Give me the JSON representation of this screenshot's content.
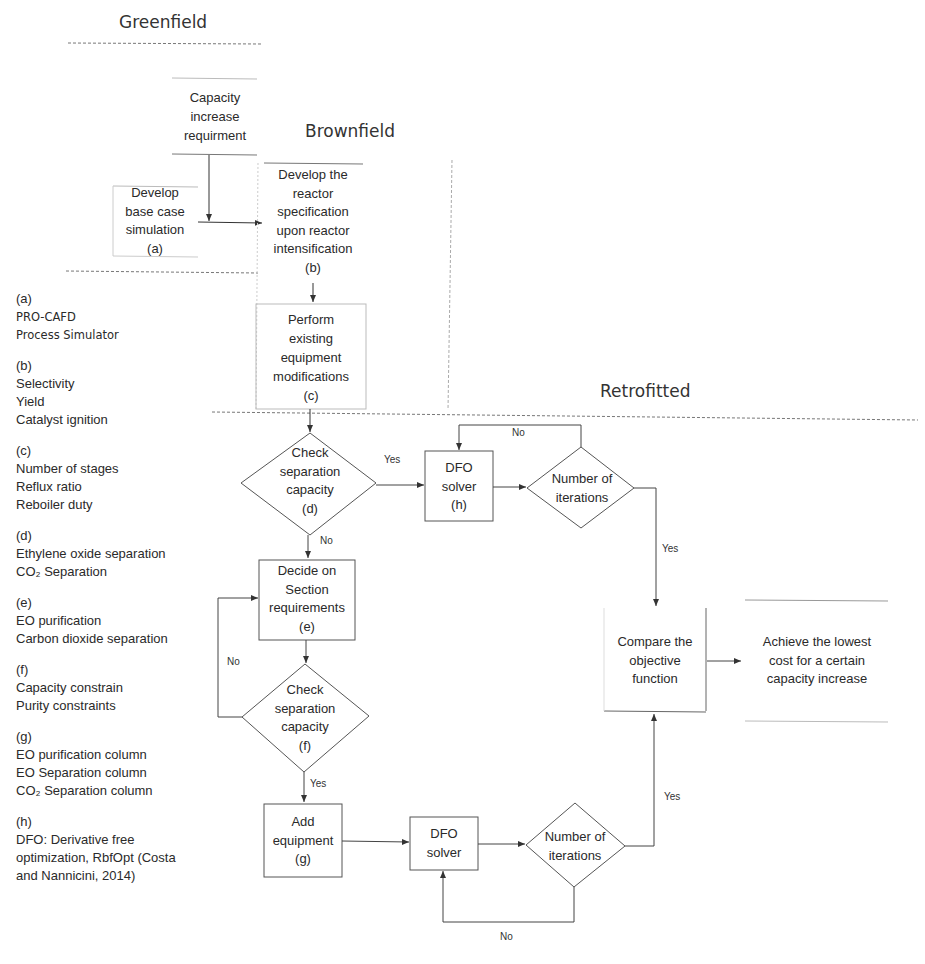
{
  "sections": {
    "greenfield": "Greenfield",
    "brownfield": "Brownfield",
    "retrofitted": "Retrofitted"
  },
  "nodes": {
    "capacity_req": [
      "Capacity",
      "increase",
      "requirment"
    ],
    "base_case": [
      "Develop",
      "base case",
      "simulation",
      "(a)"
    ],
    "reactor_spec": [
      "Develop the",
      "reactor",
      "specification",
      "upon reactor",
      "intensification",
      "(b)"
    ],
    "equip_mod": [
      "Perform",
      "existing",
      "equipment",
      "modifications",
      "(c)"
    ],
    "check_sep_d": [
      "Check",
      "separation",
      "capacity",
      "(d)"
    ],
    "dfo_h": [
      "DFO",
      "solver",
      "(h)"
    ],
    "num_iter_top": [
      "Number of",
      "iterations"
    ],
    "decide_section": [
      "Decide on",
      "Section",
      "requirements",
      "(e)"
    ],
    "check_sep_f": [
      "Check",
      "separation",
      "capacity",
      "(f)"
    ],
    "add_equip": [
      "Add",
      "equipment",
      "(g)"
    ],
    "dfo_bottom": [
      "DFO",
      "solver"
    ],
    "num_iter_bottom": [
      "Number of",
      "iterations"
    ],
    "compare_obj": [
      "Compare the",
      "objective",
      "function"
    ],
    "achieve": [
      "Achieve the lowest",
      "cost for a certain",
      "capacity increase"
    ]
  },
  "edge_labels": {
    "d_yes": "Yes",
    "d_no": "No",
    "top_iter_no": "No",
    "top_iter_yes": "Yes",
    "f_no": "No",
    "f_yes": "Yes",
    "bottom_iter_yes": "Yes",
    "bottom_iter_no": "No"
  },
  "legend": [
    {
      "key": "(a)",
      "items": [
        "PRO-CAFD",
        "Process Simulator"
      ]
    },
    {
      "key": "(b)",
      "items": [
        "Selectivity",
        "Yield",
        "Catalyst ignition"
      ]
    },
    {
      "key": "(c)",
      "items": [
        "Number of stages",
        "Reflux ratio",
        "Reboiler duty"
      ]
    },
    {
      "key": "(d)",
      "items": [
        "Ethylene oxide separation",
        "CO₂ Separation"
      ]
    },
    {
      "key": "(e)",
      "items": [
        "EO purification",
        "Carbon dioxide separation"
      ]
    },
    {
      "key": "(f)",
      "items": [
        "Capacity constrain",
        "Purity constraints"
      ]
    },
    {
      "key": "(g)",
      "items": [
        "EO purification column",
        "EO Separation column",
        "CO₂ Separation column"
      ]
    },
    {
      "key": "(h)",
      "items": [
        "DFO: Derivative free",
        "optimization, RbfOpt (Costa",
        "and Nannicini, 2014)"
      ]
    }
  ],
  "colors": {
    "line": "#444444",
    "faint": "#bbbbbb",
    "dash": "#777777"
  }
}
